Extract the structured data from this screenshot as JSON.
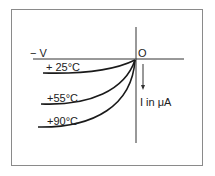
{
  "diagram": {
    "axis_labels": {
      "negative_voltage": "− V",
      "origin": "O",
      "current": "I in μA"
    },
    "curves": [
      {
        "label": "+ 25°C"
      },
      {
        "label": "+55°C"
      },
      {
        "label": "+90°C"
      }
    ],
    "colors": {
      "line": "#1a1a1a",
      "frame": "#8a8a8a",
      "background": "#ffffff"
    }
  }
}
